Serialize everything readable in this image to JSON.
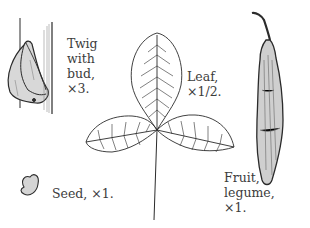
{
  "labels": {
    "twig": {
      "lines": [
        "Twig",
        "with",
        "bud,",
        "×3."
      ]
    },
    "leaf": {
      "lines": [
        "Leaf,",
        "×1/2."
      ]
    },
    "fruit": {
      "lines": [
        "Fruit,",
        "legume,",
        "×1."
      ]
    },
    "seed": {
      "text": "Seed, ×1."
    }
  }
}
